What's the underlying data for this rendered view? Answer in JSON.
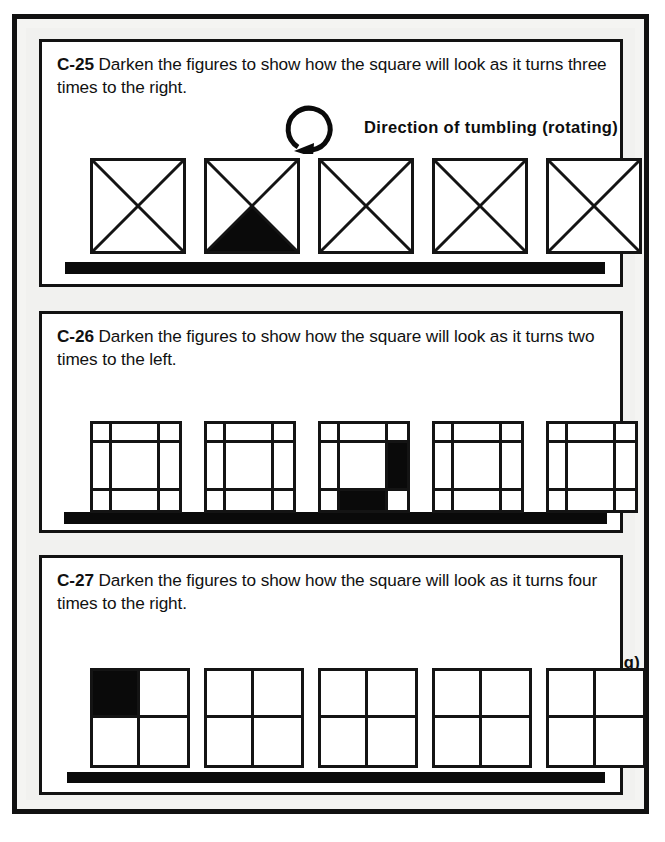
{
  "page": {
    "background_color": "#f1f1ef",
    "frame_color": "#111111",
    "ink_color": "#0a0a0a",
    "paper_color": "#ffffff"
  },
  "panels": [
    {
      "code": "C-25",
      "instruction": " Darken the figures to show how the square will look as it turns three times to the right.",
      "direction_label": "Direction of tumbling (rotating)",
      "has_arrow": true,
      "arrow_icon": "rotate-counterclockwise-icon",
      "arrow_head": "left",
      "figure_type": "x-square",
      "figure_count": 5,
      "figures": [
        {
          "shaded": "none"
        },
        {
          "shaded": "bottom"
        },
        {
          "shaded": "none"
        },
        {
          "shaded": "none"
        },
        {
          "shaded": "none"
        }
      ]
    },
    {
      "code": "C-26",
      "instruction": " Darken the figures to show how the square will look as it turns two times to the left.",
      "direction_label": "Direction of tumbling (rotating)",
      "has_arrow": true,
      "arrow_icon": "rotate-clockwise-icon",
      "arrow_head": "right",
      "figure_type": "grid-3x3",
      "figure_count": 5,
      "figures": [
        {
          "filled_cells": []
        },
        {
          "filled_cells": []
        },
        {
          "filled_cells": [
            5,
            7
          ]
        },
        {
          "filled_cells": []
        },
        {
          "filled_cells": []
        }
      ]
    },
    {
      "code": "C-27",
      "instruction": " Darken the figures to show how the square will look as it turns four times to the right.",
      "direction_label": "",
      "has_arrow": false,
      "arrow_icon": "",
      "arrow_head": "",
      "figure_type": "grid-2x2",
      "figure_count": 5,
      "figures": [
        {
          "filled_cells": [
            0
          ]
        },
        {
          "filled_cells": []
        },
        {
          "filled_cells": []
        },
        {
          "filled_cells": []
        },
        {
          "filled_cells": []
        }
      ]
    }
  ],
  "layout": {
    "panel_0_figures": [
      {
        "left": 48,
        "top": 10,
        "size": 96
      },
      {
        "left": 162,
        "top": 10,
        "size": 96
      },
      {
        "left": 276,
        "top": 10,
        "size": 96
      },
      {
        "left": 390,
        "top": 10,
        "size": 96
      },
      {
        "left": 504,
        "top": 10,
        "size": 96
      }
    ],
    "panel_1_figures": [
      {
        "left": 48,
        "top": 8,
        "size": 92
      },
      {
        "left": 162,
        "top": 8,
        "size": 92
      },
      {
        "left": 276,
        "top": 8,
        "size": 92
      },
      {
        "left": 390,
        "top": 8,
        "size": 92
      },
      {
        "left": 504,
        "top": 8,
        "size": 92
      }
    ],
    "panel_2_figures": [
      {
        "left": 48,
        "top": 8,
        "size": 100
      },
      {
        "left": 162,
        "top": 8,
        "size": 100
      },
      {
        "left": 276,
        "top": 8,
        "size": 100
      },
      {
        "left": 390,
        "top": 8,
        "size": 100
      },
      {
        "left": 504,
        "top": 8,
        "size": 100
      }
    ]
  }
}
